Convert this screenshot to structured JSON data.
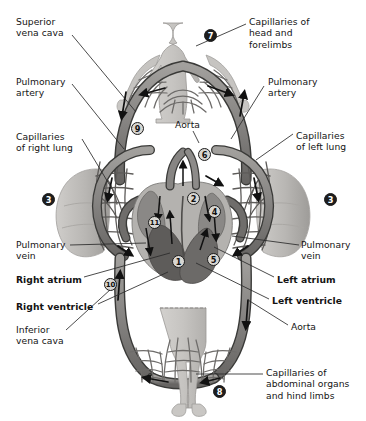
{
  "figure": {
    "palette": {
      "background": "#ffffff",
      "text": "#141414",
      "vessel_fill": "#8e8c8a",
      "vessel_dark": "#5b5a58",
      "vessel_outline": "#3a3a38",
      "body_fill": "#c9c7c4",
      "body_outline": "#8d8b88",
      "lung_fill": "#bdbbb8",
      "lung_shade": "#a6a4a0",
      "capillary": "#6e6c6a",
      "heart_light": "#b4b2af",
      "heart_mid": "#8a8886",
      "heart_dark": "#5e5c5a",
      "marker_open_fill": "#d8d6d2",
      "marker_filled_fill": "#1d1d1d",
      "arrow": "#111111",
      "leader_line": "#2a2a2a"
    }
  },
  "labels": [
    {
      "id": "superior-vena-cava",
      "text": "Superior\nvena cava",
      "bold": false,
      "x": 16,
      "y": 16,
      "align": "left"
    },
    {
      "id": "pulmonary-artery-left",
      "text": "Pulmonary\nartery",
      "bold": false,
      "x": 16,
      "y": 76,
      "align": "left"
    },
    {
      "id": "capillaries-of-right-lung",
      "text": "Capillaries\nof right lung",
      "bold": false,
      "x": 16,
      "y": 131,
      "align": "left"
    },
    {
      "id": "pulmonary-vein-left",
      "text": "Pulmonary\nvein",
      "bold": false,
      "x": 16,
      "y": 239,
      "align": "left"
    },
    {
      "id": "right-atrium",
      "text": "Right atrium",
      "bold": true,
      "x": 16,
      "y": 274,
      "align": "left"
    },
    {
      "id": "right-ventricle",
      "text": "Right ventricle",
      "bold": true,
      "x": 16,
      "y": 301,
      "align": "left"
    },
    {
      "id": "inferior-vena-cava",
      "text": "Inferior\nvena cava",
      "bold": false,
      "x": 16,
      "y": 324,
      "align": "left"
    },
    {
      "id": "capillaries-of-head-and-forelimbs",
      "text": "Capillaries of\nhead and\nforelimbs",
      "bold": false,
      "x": 249,
      "y": 16,
      "align": "left"
    },
    {
      "id": "pulmonary-artery-right",
      "text": "Pulmonary\nartery",
      "bold": false,
      "x": 268,
      "y": 76,
      "align": "left"
    },
    {
      "id": "capillaries-of-left-lung",
      "text": "Capillaries\nof left lung",
      "bold": false,
      "x": 296,
      "y": 130,
      "align": "left"
    },
    {
      "id": "pulmonary-vein-right",
      "text": "Pulmonary\nvein",
      "bold": false,
      "x": 301,
      "y": 239,
      "align": "left"
    },
    {
      "id": "left-atrium",
      "text": "Left atrium",
      "bold": true,
      "x": 277,
      "y": 274,
      "align": "left"
    },
    {
      "id": "left-ventricle",
      "text": "Left ventricle",
      "bold": true,
      "x": 272,
      "y": 295,
      "align": "left"
    },
    {
      "id": "aorta-right",
      "text": "Aorta",
      "bold": false,
      "x": 291,
      "y": 321,
      "align": "left"
    },
    {
      "id": "aorta-center",
      "text": "Aorta",
      "bold": false,
      "x": 175,
      "y": 119,
      "align": "left"
    },
    {
      "id": "capillaries-of-abdominal-organs",
      "text": "Capillaries of\nabdominal organs\nand hind limbs",
      "bold": false,
      "x": 266,
      "y": 367,
      "align": "left"
    }
  ],
  "markers": [
    {
      "id": "marker-1",
      "number": "1",
      "style": "open",
      "x": 172,
      "y": 255
    },
    {
      "id": "marker-2",
      "number": "2",
      "style": "open",
      "x": 187,
      "y": 192
    },
    {
      "id": "marker-3-left",
      "number": "3",
      "style": "filled",
      "x": 42,
      "y": 193
    },
    {
      "id": "marker-3-right",
      "number": "3",
      "style": "filled",
      "x": 324,
      "y": 193
    },
    {
      "id": "marker-4",
      "number": "4",
      "style": "open",
      "x": 208,
      "y": 205
    },
    {
      "id": "marker-5",
      "number": "5",
      "style": "open",
      "x": 207,
      "y": 253
    },
    {
      "id": "marker-6",
      "number": "6",
      "style": "open",
      "x": 198,
      "y": 148
    },
    {
      "id": "marker-7",
      "number": "7",
      "style": "filled",
      "x": 204,
      "y": 29
    },
    {
      "id": "marker-8",
      "number": "8",
      "style": "filled",
      "x": 213,
      "y": 385
    },
    {
      "id": "marker-9",
      "number": "9",
      "style": "open",
      "x": 131,
      "y": 122
    },
    {
      "id": "marker-10",
      "number": "10",
      "style": "open",
      "x": 104,
      "y": 278
    },
    {
      "id": "marker-11",
      "number": "11",
      "style": "open",
      "x": 148,
      "y": 216
    }
  ],
  "leaders": [
    {
      "id": "leader-superior-vena-cava",
      "points": "72,35 136,112"
    },
    {
      "id": "leader-pulmonary-artery-left",
      "points": "72,84 124,149"
    },
    {
      "id": "leader-capillaries-right-lung",
      "points": "82,139 112,189"
    },
    {
      "id": "leader-pulmonary-vein-left",
      "points": "70,245 146,243"
    },
    {
      "id": "leader-right-atrium",
      "points": "84,277 170,253"
    },
    {
      "id": "leader-right-ventricle",
      "points": "92,304 168,272"
    },
    {
      "id": "leader-inferior-vena-cava",
      "points": "66,330 111,289"
    },
    {
      "id": "leader-capillaries-head",
      "points": "246,24 196,46"
    },
    {
      "id": "leader-pulmonary-artery-right",
      "points": "264,86 231,139"
    },
    {
      "id": "leader-capillaries-left-lung",
      "points": "293,134 256,160"
    },
    {
      "id": "leader-pulmonary-vein-right",
      "points": "299,245 232,236"
    },
    {
      "id": "leader-left-atrium",
      "points": "274,277 214,247"
    },
    {
      "id": "leader-left-ventricle",
      "points": "269,299 196,263"
    },
    {
      "id": "leader-aorta-right",
      "points": "288,325 248,300"
    },
    {
      "id": "leader-aorta-center",
      "points": "193,131 199,143"
    },
    {
      "id": "leader-capillaries-abdominal",
      "points": "263,374 196,374"
    }
  ]
}
